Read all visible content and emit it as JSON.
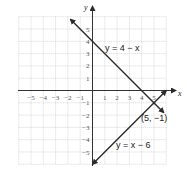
{
  "chart_data": {
    "type": "line",
    "title": "",
    "xlabel": "x",
    "ylabel": "y",
    "xlim": [
      -6,
      6
    ],
    "ylim": [
      -6,
      6
    ],
    "grid": true,
    "x_ticks": [
      "-5",
      "-4",
      "-3",
      "-2",
      "-1",
      "1",
      "2",
      "3",
      "4",
      "5"
    ],
    "y_ticks": [
      "5",
      "4",
      "3",
      "2",
      "1",
      "-1",
      "-2",
      "-3",
      "-4",
      "-5"
    ],
    "series": [
      {
        "name": "y = 4 - x",
        "label": "y = 4 − x",
        "x": [
          -1.8,
          5.8
        ],
        "y": [
          5.8,
          -1.8
        ]
      },
      {
        "name": "y = x - 6",
        "label": "y = x − 6",
        "x": [
          0,
          6
        ],
        "y": [
          -6,
          0
        ]
      }
    ],
    "annotations": [
      {
        "text": "(5, −1)",
        "x": 5,
        "y": -1
      }
    ]
  }
}
